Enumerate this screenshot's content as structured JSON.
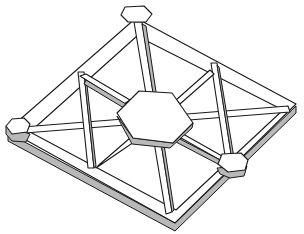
{
  "diagram": {
    "colors": {
      "background": "#ffffff",
      "stroke": "#1a1a1a",
      "face": "#ffffff",
      "shadow": "#b8b8b8"
    },
    "nodes": [
      {
        "name": "top-node",
        "shape": "hexagon"
      },
      {
        "name": "left-node",
        "shape": "hexagon"
      },
      {
        "name": "right-node",
        "shape": "hexagon"
      },
      {
        "name": "center-hub",
        "shape": "hexagon"
      }
    ]
  }
}
